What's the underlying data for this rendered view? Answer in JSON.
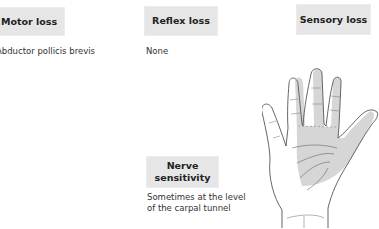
{
  "boxes": {
    "motor_loss": "Motor loss",
    "reflex_loss": "Reflex loss",
    "sensory_loss": "Sensory loss",
    "nerve_sensitivity": [
      "Nerve",
      "sensitivity"
    ]
  },
  "descriptions": {
    "motor_loss": "Abductor pollicis brevis",
    "reflex_loss": "None",
    "nerve_sensitivity": [
      "Sometimes at the level",
      "of the carpal tunnel"
    ]
  },
  "illustration": {
    "name": "hand-palm-icon",
    "shaded_region": "median nerve sensory distribution",
    "shade_color": "#d6d6d6",
    "outline_color": "#555555"
  },
  "colors": {
    "box_background": "#e6e6e6",
    "text": "#333333"
  }
}
